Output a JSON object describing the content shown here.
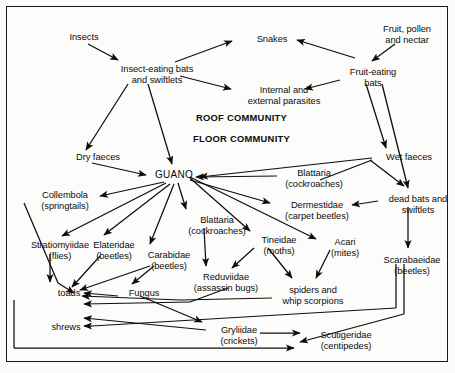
{
  "diagram": {
    "sections": {
      "roof": "ROOF COMMUNITY",
      "floor": "FLOOR COMMUNITY"
    },
    "colors": {
      "ink": "#0d0d0d",
      "background": "#fcfcfa",
      "border": "#1a1a1a"
    },
    "nodes": [
      {
        "id": "insects",
        "label": "Insects",
        "x": 58,
        "y": 32,
        "w": 52
      },
      {
        "id": "insect_bats",
        "label": "Insect-eating bats\nand swiftlets",
        "x": 108,
        "y": 64,
        "w": 98
      },
      {
        "id": "snakes",
        "label": "Snakes",
        "x": 248,
        "y": 34,
        "w": 48
      },
      {
        "id": "parasites",
        "label": "Internal and\nexternal parasites",
        "x": 238,
        "y": 85,
        "w": 92
      },
      {
        "id": "fruit_pollen",
        "label": "Fruit, pollen\nand nectar",
        "x": 371,
        "y": 24,
        "w": 72
      },
      {
        "id": "fruit_bats",
        "label": "Fruit-eating\nbats",
        "x": 340,
        "y": 67,
        "w": 66
      },
      {
        "id": "dry_faeces",
        "label": "Dry faeces",
        "x": 68,
        "y": 152,
        "w": 60
      },
      {
        "id": "wet_faeces",
        "label": "Wet faeces",
        "x": 378,
        "y": 152,
        "w": 62
      },
      {
        "id": "guano",
        "label": "GUANO",
        "x": 152,
        "y": 170,
        "w": 44
      },
      {
        "id": "blattaria_right",
        "label": "Blattaria\n(cockroaches)",
        "x": 279,
        "y": 168,
        "w": 70
      },
      {
        "id": "dead_bats",
        "label": "dead bats and\nswiftlets",
        "x": 381,
        "y": 194,
        "w": 74
      },
      {
        "id": "collembola",
        "label": "Collembola\n(springtails)",
        "x": 32,
        "y": 190,
        "w": 66
      },
      {
        "id": "dermestidae",
        "label": "Dermestidae\n(carpet beetles)",
        "x": 277,
        "y": 200,
        "w": 80
      },
      {
        "id": "blattaria_mid",
        "label": "Blattaria\n(cockroaches)",
        "x": 182,
        "y": 215,
        "w": 70
      },
      {
        "id": "tineidae",
        "label": "Tineidae\n(moths)",
        "x": 254,
        "y": 235,
        "w": 50
      },
      {
        "id": "acari",
        "label": "Acari\n(mites)",
        "x": 324,
        "y": 237,
        "w": 42
      },
      {
        "id": "stratiomyiidae",
        "label": "Stratiomyiidae\n(flies)",
        "x": 22,
        "y": 240,
        "w": 76
      },
      {
        "id": "elateridae",
        "label": "Elateridae\n(beetles)",
        "x": 86,
        "y": 240,
        "w": 56
      },
      {
        "id": "carabidae",
        "label": "Carabidae\n(beetles)",
        "x": 140,
        "y": 250,
        "w": 58
      },
      {
        "id": "reduviidae",
        "label": "Reduviidae\n(assassin bugs)",
        "x": 186,
        "y": 272,
        "w": 80
      },
      {
        "id": "scarabaeidae",
        "label": "Scarabaeidae\n(beetles)",
        "x": 375,
        "y": 255,
        "w": 74
      },
      {
        "id": "spiders",
        "label": "spiders and\nwhip scorpions",
        "x": 274,
        "y": 285,
        "w": 78
      },
      {
        "id": "fungus",
        "label": "Fungus",
        "x": 122,
        "y": 288,
        "w": 44
      },
      {
        "id": "toads",
        "label": "toads",
        "x": 52,
        "y": 288,
        "w": 34
      },
      {
        "id": "shrews",
        "label": "shrews",
        "x": 46,
        "y": 322,
        "w": 40
      },
      {
        "id": "gryliidae",
        "label": "Gryliidae\n(crickets)",
        "x": 212,
        "y": 325,
        "w": 54
      },
      {
        "id": "scutigeridae",
        "label": "Scutigeridae\n(centipedes)",
        "x": 308,
        "y": 330,
        "w": 76
      }
    ],
    "edges": [
      {
        "from": "insects",
        "to": "insect_bats"
      },
      {
        "from": "insect_bats",
        "to": "snakes"
      },
      {
        "from": "insect_bats",
        "to": "parasites"
      },
      {
        "from": "fruit_pollen",
        "to": "fruit_bats"
      },
      {
        "from": "fruit_bats",
        "to": "snakes"
      },
      {
        "from": "fruit_bats",
        "to": "parasites"
      },
      {
        "from": "insect_bats",
        "to": "dry_faeces"
      },
      {
        "from": "insect_bats",
        "to": "guano"
      },
      {
        "from": "fruit_bats",
        "to": "wet_faeces"
      },
      {
        "from": "fruit_bats",
        "to": "dead_bats"
      },
      {
        "from": "dry_faeces",
        "to": "guano"
      },
      {
        "from": "wet_faeces",
        "to": "guano"
      },
      {
        "from": "wet_faeces",
        "to": "dead_bats"
      },
      {
        "from": "blattaria_right",
        "to": "guano"
      },
      {
        "from": "guano",
        "to": "collembola"
      },
      {
        "from": "guano",
        "to": "stratiomyiidae"
      },
      {
        "from": "guano",
        "to": "elateridae"
      },
      {
        "from": "guano",
        "to": "carabidae"
      },
      {
        "from": "guano",
        "to": "blattaria_mid"
      },
      {
        "from": "guano",
        "to": "dermestidae"
      },
      {
        "from": "guano",
        "to": "tineidae"
      },
      {
        "from": "guano",
        "to": "acari"
      },
      {
        "from": "dead_bats",
        "to": "dermestidae"
      },
      {
        "from": "dead_bats",
        "to": "scarabaeidae"
      },
      {
        "from": "blattaria_mid",
        "to": "reduviidae"
      },
      {
        "from": "tineidae",
        "to": "reduviidae"
      },
      {
        "from": "tineidae",
        "to": "spiders"
      },
      {
        "from": "dermestidae",
        "to": "acari"
      },
      {
        "from": "acari",
        "to": "spiders"
      },
      {
        "from": "stratiomyiidae",
        "to": "toads"
      },
      {
        "from": "elateridae",
        "to": "toads"
      },
      {
        "from": "carabidae",
        "to": "toads"
      },
      {
        "from": "collembola",
        "to": "toads"
      },
      {
        "from": "fungus",
        "to": "toads"
      },
      {
        "from": "spiders",
        "to": "toads"
      },
      {
        "from": "reduviidae",
        "to": "toads"
      },
      {
        "from": "gryliidae",
        "to": "shrews"
      },
      {
        "from": "fungus",
        "to": "gryliidae"
      },
      {
        "from": "scarabaeidae",
        "to": "shrews"
      },
      {
        "from": "gryliidae",
        "to": "scutigeridae"
      },
      {
        "from": "scarabaeidae",
        "to": "scutigeridae"
      },
      {
        "from": "carabidae",
        "to": "fungus"
      },
      {
        "from": "guano",
        "to": "fungus"
      }
    ]
  }
}
